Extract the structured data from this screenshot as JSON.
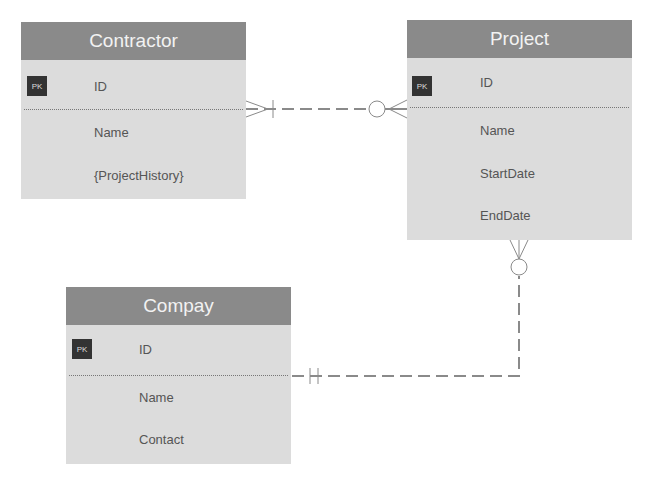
{
  "entities": [
    {
      "name": "Contractor",
      "pk_label": "PK",
      "fields": [
        "ID",
        "Name",
        "{ProjectHistory}"
      ]
    },
    {
      "name": "Project",
      "pk_label": "PK",
      "fields": [
        "ID",
        "Name",
        "StartDate",
        "EndDate"
      ]
    },
    {
      "name": "Compay",
      "pk_label": "PK",
      "fields": [
        "ID",
        "Name",
        "Contact"
      ]
    }
  ],
  "relationships": [
    {
      "from": "Contractor",
      "to": "Project",
      "from_cardinality": "one-and-many",
      "to_cardinality": "zero-or-many"
    },
    {
      "from": "Compay",
      "to": "Project",
      "from_cardinality": "one-and-only-one",
      "to_cardinality": "zero-or-many"
    }
  ]
}
